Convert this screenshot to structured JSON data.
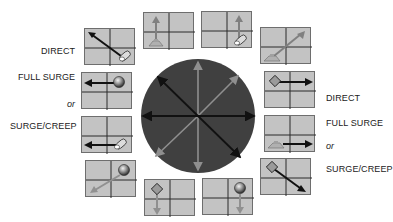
{
  "diagram": {
    "left_labels": {
      "direct": "DIRECT",
      "full_surge": "FULL SURGE",
      "or": "or",
      "surge_creep": "SURGE/CREEP"
    },
    "right_labels": {
      "direct": "DIRECT",
      "full_surge": "FULL SURGE",
      "or": "or",
      "surge_creep": "SURGE/CREEP"
    },
    "center": {
      "shape": "circle",
      "fill": "#3f3f3f",
      "arrows": [
        {
          "axis": "horizontal",
          "color": "#111111"
        },
        {
          "axis": "vertical",
          "color": "#8a8a8a"
        },
        {
          "axis": "diagonal-nw-se",
          "color": "#111111"
        },
        {
          "axis": "diagonal-ne-sw",
          "color": "#8a8a8a"
        }
      ]
    },
    "boxes": [
      {
        "id": "nw",
        "direction": "northwest",
        "piece": "pill",
        "arrow_color": "#111111"
      },
      {
        "id": "n-left",
        "direction": "north",
        "piece": "tank",
        "arrow_color": "#8a8a8a"
      },
      {
        "id": "n-right",
        "direction": "north",
        "piece": "pill",
        "arrow_color": "#8a8a8a"
      },
      {
        "id": "ne",
        "direction": "northeast",
        "piece": "tank",
        "arrow_color": "#8a8a8a"
      },
      {
        "id": "w-top",
        "direction": "west",
        "piece": "sphere",
        "arrow_color": "#111111"
      },
      {
        "id": "w-bottom",
        "direction": "west",
        "piece": "pill",
        "arrow_color": "#111111"
      },
      {
        "id": "e-top",
        "direction": "east",
        "piece": "diamond",
        "arrow_color": "#111111"
      },
      {
        "id": "e-bottom",
        "direction": "east",
        "piece": "tank",
        "arrow_color": "#111111"
      },
      {
        "id": "sw",
        "direction": "southwest",
        "piece": "sphere",
        "arrow_color": "#8a8a8a"
      },
      {
        "id": "s-left",
        "direction": "south",
        "piece": "diamond",
        "arrow_color": "#8a8a8a"
      },
      {
        "id": "s-right",
        "direction": "south",
        "piece": "sphere",
        "arrow_color": "#8a8a8a"
      },
      {
        "id": "se",
        "direction": "southeast",
        "piece": "diamond",
        "arrow_color": "#111111"
      }
    ],
    "colors": {
      "box_fill": "#c3c3c3",
      "grid_line": "#2a2a2a",
      "dark_arrow": "#111111",
      "light_arrow": "#8a8a8a"
    }
  }
}
